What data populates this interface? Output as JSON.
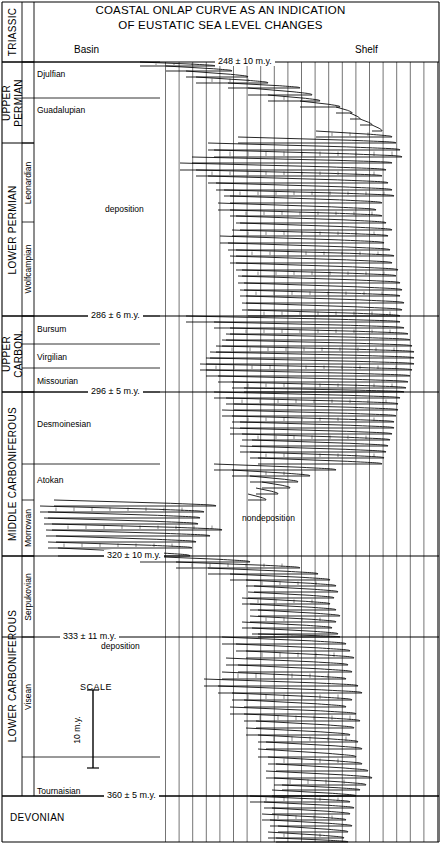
{
  "title": {
    "line1": "COASTAL ONLAP CURVE AS AN INDICATION",
    "line2": "OF EUSTATIC SEA LEVEL CHANGES"
  },
  "axis_headers": {
    "left": "Basin",
    "right": "Shelf"
  },
  "annotations": {
    "deposition_upper": "deposition",
    "nondeposition": "nondeposition",
    "deposition_lower": "deposition",
    "scale_title": "SCALE",
    "scale_value": "10 m.y."
  },
  "periods": [
    {
      "name": "TRIASSIC",
      "y0": 2,
      "y1": 62
    },
    {
      "name": "UPPER\nPERMIAN",
      "y0": 62,
      "y1": 143
    },
    {
      "name": "LOWER PERMIAN",
      "y0": 143,
      "y1": 316
    },
    {
      "name": "UPPER\nCARBON.",
      "y0": 316,
      "y1": 392
    },
    {
      "name": "MIDDLE CARBONIFEROUS",
      "y0": 392,
      "y1": 556
    },
    {
      "name": "LOWER CARBONIFEROUS",
      "y0": 556,
      "y1": 796
    },
    {
      "name": "DEVONIAN",
      "y0": 796,
      "y1": 842
    }
  ],
  "stages": [
    {
      "name": "Djulfian",
      "y0": 62,
      "y1": 98,
      "label_y": 74
    },
    {
      "name": "Guadalupian",
      "y0": 98,
      "y1": 143,
      "label_y": 110
    },
    {
      "name": "Leonardian",
      "y0": 143,
      "y1": 222,
      "rotated": true
    },
    {
      "name": "Wolfcampian",
      "y0": 222,
      "y1": 316,
      "rotated": true
    },
    {
      "name": "Bursum",
      "y0": 316,
      "y1": 344,
      "label_y": 329
    },
    {
      "name": "Virgilian",
      "y0": 344,
      "y1": 368,
      "label_y": 357
    },
    {
      "name": "Missourian",
      "y0": 368,
      "y1": 392,
      "label_y": 381
    },
    {
      "name": "Desmoinesian",
      "y0": 392,
      "y1": 464,
      "label_y": 424
    },
    {
      "name": "Atokan",
      "y0": 464,
      "y1": 500,
      "label_y": 480
    },
    {
      "name": "Morrowan",
      "y0": 500,
      "y1": 556,
      "rotated": true
    },
    {
      "name": "Serpukovian",
      "y0": 556,
      "y1": 637,
      "rotated": true
    },
    {
      "name": "Visean",
      "y0": 637,
      "y1": 757,
      "rotated": true
    },
    {
      "name": "Tournaisian",
      "y0": 757,
      "y1": 796,
      "label_y": 791
    }
  ],
  "age_markers": [
    {
      "text": "248 ± 10 m.y.",
      "y": 62,
      "x": 215
    },
    {
      "text": "286 ± 6 m.y.",
      "y": 316,
      "x": 88
    },
    {
      "text": "296 ± 5 m.y.",
      "y": 392,
      "x": 88
    },
    {
      "text": "320 ± 10 m.y.",
      "y": 556,
      "x": 104
    },
    {
      "text": "333 ± 11 m.y.",
      "y": 637,
      "x": 60
    },
    {
      "text": "360 ± 5 m.y.",
      "y": 796,
      "x": 104
    }
  ],
  "chart_data": {
    "type": "line",
    "title": "COASTAL ONLAP CURVE AS AN INDICATION OF EUSTATIC SEA LEVEL CHANGES",
    "xlabel": "",
    "ylabel": "Age (m.y. before present)",
    "x_direction": "Basin (left) to Shelf (right)",
    "ylim": [
      248,
      360
    ],
    "grid": true,
    "legend": null,
    "series": [
      {
        "name": "coastal onlap",
        "description": "Onlap cycles given as [y_top, x_basin, y_bottom, x_shelf] in pixel space of the chart panel (x increases toward shelf).",
        "cycles": [
          [
            62,
            140,
            66,
            215
          ],
          [
            66,
            166,
            71,
            232
          ],
          [
            71,
            186,
            77,
            248
          ],
          [
            77,
            196,
            83,
            268
          ],
          [
            83,
            228,
            88,
            300
          ],
          [
            88,
            248,
            95,
            312
          ],
          [
            95,
            268,
            101,
            320
          ],
          [
            101,
            300,
            107,
            340
          ],
          [
            107,
            336,
            113,
            352
          ],
          [
            113,
            350,
            119,
            360
          ],
          [
            119,
            360,
            125,
            372
          ],
          [
            125,
            372,
            131,
            382
          ],
          [
            131,
            316,
            137,
            392
          ],
          [
            137,
            238,
            143,
            396
          ],
          [
            143,
            208,
            150,
            400
          ],
          [
            150,
            214,
            157,
            402
          ],
          [
            157,
            192,
            163,
            392
          ],
          [
            163,
            180,
            170,
            386
          ],
          [
            170,
            196,
            176,
            382
          ],
          [
            176,
            208,
            183,
            388
          ],
          [
            183,
            216,
            190,
            392
          ],
          [
            190,
            224,
            196,
            394
          ],
          [
            196,
            230,
            203,
            382
          ],
          [
            203,
            218,
            210,
            376
          ],
          [
            210,
            230,
            216,
            382
          ],
          [
            216,
            236,
            223,
            386
          ],
          [
            223,
            240,
            230,
            392
          ],
          [
            230,
            232,
            236,
            388
          ],
          [
            236,
            220,
            243,
            384
          ],
          [
            243,
            228,
            250,
            390
          ],
          [
            250,
            236,
            256,
            394
          ],
          [
            256,
            230,
            263,
            392
          ],
          [
            263,
            236,
            270,
            398
          ],
          [
            270,
            242,
            276,
            396
          ],
          [
            276,
            238,
            283,
            400
          ],
          [
            283,
            244,
            290,
            402
          ],
          [
            290,
            240,
            296,
            400
          ],
          [
            296,
            246,
            303,
            404
          ],
          [
            303,
            242,
            310,
            402
          ],
          [
            310,
            248,
            316,
            400
          ],
          [
            316,
            186,
            322,
            400
          ],
          [
            322,
            214,
            328,
            404
          ],
          [
            328,
            230,
            334,
            408
          ],
          [
            334,
            226,
            340,
            410
          ],
          [
            340,
            222,
            346,
            412
          ],
          [
            346,
            216,
            352,
            414
          ],
          [
            352,
            210,
            358,
            414
          ],
          [
            358,
            206,
            364,
            414
          ],
          [
            364,
            200,
            370,
            412
          ],
          [
            370,
            206,
            376,
            410
          ],
          [
            376,
            218,
            382,
            408
          ],
          [
            382,
            232,
            388,
            406
          ],
          [
            388,
            244,
            392,
            404
          ],
          [
            392,
            214,
            398,
            400
          ],
          [
            398,
            226,
            404,
            398
          ],
          [
            404,
            234,
            410,
            398
          ],
          [
            410,
            222,
            416,
            396
          ],
          [
            416,
            232,
            422,
            394
          ],
          [
            422,
            240,
            428,
            394
          ],
          [
            428,
            230,
            434,
            392
          ],
          [
            434,
            242,
            440,
            390
          ],
          [
            440,
            252,
            446,
            388
          ],
          [
            446,
            240,
            452,
            386
          ],
          [
            452,
            250,
            458,
            384
          ],
          [
            458,
            258,
            464,
            382
          ],
          [
            464,
            214,
            470,
            336
          ],
          [
            470,
            232,
            476,
            310
          ],
          [
            476,
            250,
            482,
            298
          ],
          [
            482,
            262,
            488,
            290
          ],
          [
            488,
            256,
            494,
            278
          ],
          [
            494,
            248,
            500,
            266
          ],
          [
            500,
            54,
            506,
            216
          ],
          [
            506,
            40,
            512,
            204
          ],
          [
            512,
            48,
            518,
            200
          ],
          [
            518,
            44,
            524,
            198
          ],
          [
            524,
            52,
            530,
            222
          ],
          [
            530,
            46,
            536,
            210
          ],
          [
            536,
            56,
            542,
            196
          ],
          [
            542,
            48,
            548,
            192
          ],
          [
            548,
            58,
            556,
            190
          ],
          [
            556,
            140,
            562,
            250
          ],
          [
            562,
            176,
            568,
            300
          ],
          [
            568,
            208,
            574,
            318
          ],
          [
            574,
            230,
            580,
            330
          ],
          [
            580,
            246,
            586,
            336
          ],
          [
            586,
            254,
            592,
            338
          ],
          [
            592,
            248,
            598,
            334
          ],
          [
            598,
            242,
            604,
            330
          ],
          [
            604,
            250,
            610,
            336
          ],
          [
            610,
            258,
            616,
            340
          ],
          [
            616,
            250,
            622,
            336
          ],
          [
            622,
            242,
            628,
            332
          ],
          [
            628,
            252,
            634,
            338
          ],
          [
            634,
            258,
            637,
            340
          ],
          [
            637,
            222,
            644,
            346
          ],
          [
            644,
            236,
            651,
            350
          ],
          [
            651,
            246,
            658,
            354
          ],
          [
            658,
            226,
            665,
            348
          ],
          [
            665,
            238,
            672,
            352
          ],
          [
            672,
            222,
            679,
            346
          ],
          [
            679,
            204,
            686,
            358
          ],
          [
            686,
            218,
            693,
            362
          ],
          [
            693,
            232,
            700,
            352
          ],
          [
            700,
            244,
            707,
            346
          ],
          [
            707,
            230,
            714,
            356
          ],
          [
            714,
            244,
            721,
            360
          ],
          [
            721,
            256,
            728,
            354
          ],
          [
            728,
            246,
            735,
            350
          ],
          [
            735,
            258,
            742,
            358
          ],
          [
            742,
            266,
            749,
            362
          ],
          [
            749,
            258,
            757,
            356
          ],
          [
            757,
            268,
            764,
            362
          ],
          [
            764,
            276,
            771,
            368
          ],
          [
            771,
            266,
            778,
            372
          ],
          [
            778,
            274,
            785,
            366
          ],
          [
            785,
            282,
            790,
            360
          ],
          [
            790,
            272,
            796,
            356
          ],
          [
            796,
            250,
            802,
            350
          ],
          [
            802,
            264,
            808,
            354
          ],
          [
            808,
            272,
            814,
            350
          ],
          [
            814,
            262,
            820,
            346
          ],
          [
            820,
            270,
            826,
            352
          ],
          [
            826,
            278,
            832,
            348
          ],
          [
            832,
            268,
            838,
            344
          ],
          [
            838,
            276,
            842,
            348
          ]
        ]
      }
    ]
  }
}
